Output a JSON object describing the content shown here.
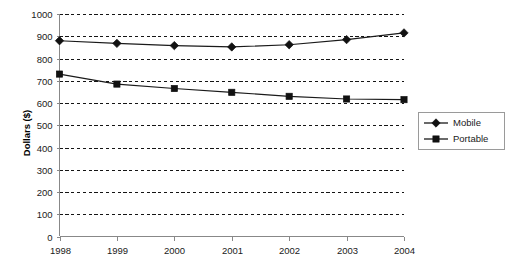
{
  "chart_data": {
    "type": "line",
    "title": "",
    "xlabel": "",
    "ylabel": "Dollars ($)",
    "categories": [
      "1998",
      "1999",
      "2000",
      "2001",
      "2002",
      "2003",
      "2004"
    ],
    "x": [
      1998,
      1999,
      2000,
      2001,
      2002,
      2003,
      2004
    ],
    "series": [
      {
        "name": "Mobile",
        "marker": "diamond",
        "color": "#111111",
        "values": [
          880,
          868,
          858,
          852,
          862,
          885,
          915
        ]
      },
      {
        "name": "Portable",
        "marker": "square",
        "color": "#111111",
        "values": [
          730,
          685,
          665,
          648,
          630,
          618,
          615
        ]
      }
    ],
    "ylim": [
      0,
      1000
    ],
    "y_ticks": [
      0,
      100,
      200,
      300,
      400,
      500,
      600,
      700,
      800,
      900,
      1000
    ],
    "y_tick_labels": [
      "0",
      "100",
      "200",
      "300",
      "400",
      "500",
      "600",
      "700",
      "800",
      "900",
      "1000"
    ],
    "x_tick_labels": [
      "1998",
      "1999",
      "2000",
      "2001",
      "2002",
      "2003",
      "2004"
    ],
    "grid": true,
    "grid_style": "dashed-horizontal",
    "legend": true,
    "legend_position": "right",
    "legend_entries": [
      "Mobile",
      "Portable"
    ],
    "background": "#ffffff"
  }
}
